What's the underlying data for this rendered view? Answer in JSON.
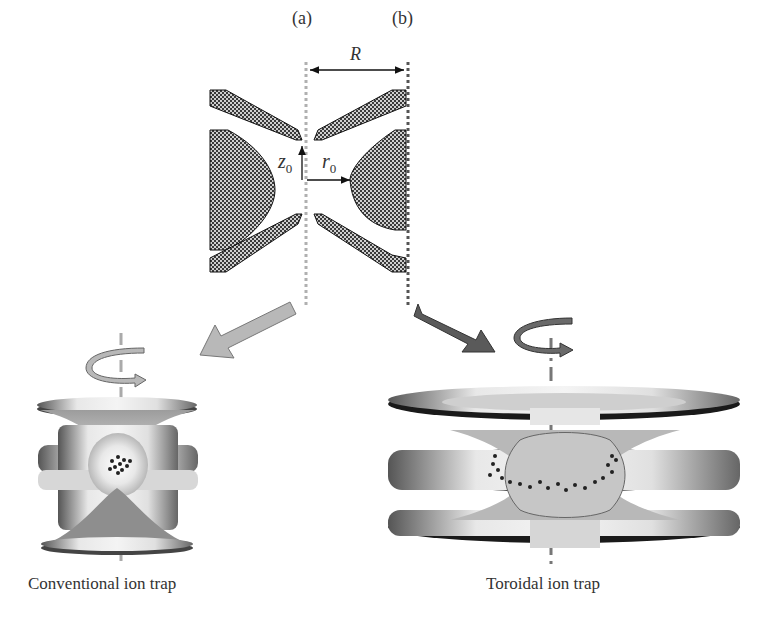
{
  "figure": {
    "top_schematic": {
      "line_a_label": "(a)",
      "line_b_label": "(b)",
      "distance_label": "R",
      "z_label": "z",
      "z_subscript": "0",
      "r_label": "r",
      "r_subscript": "0"
    },
    "left_panel": {
      "caption": "Conventional ion trap",
      "arrow_color": "#b8b8b8"
    },
    "right_panel": {
      "caption": "Toroidal ion trap",
      "arrow_color": "#5a5a5a"
    },
    "colors": {
      "electrode_fill": "#8a8a8a",
      "electrode_stroke": "#222222",
      "line_a": "#b0b0b0",
      "line_b": "#555555",
      "ion": "#222222"
    }
  }
}
